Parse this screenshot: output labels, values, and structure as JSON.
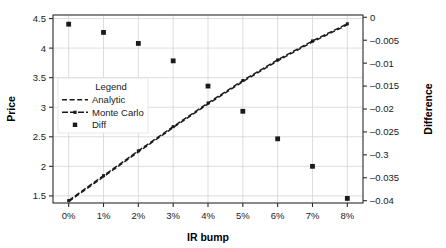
{
  "chart_data": {
    "type": "scatter",
    "title": "",
    "xlabel": "IR bump",
    "ylabel": "Price",
    "y2label": "Difference",
    "grid": true,
    "legend_position": "center-left",
    "legend_title": "Legend",
    "x": [
      0,
      1,
      2,
      3,
      4,
      5,
      6,
      7,
      8
    ],
    "xtick_labels": [
      "0%",
      "1%",
      "2%",
      "3%",
      "4%",
      "5%",
      "6%",
      "7%",
      "8%"
    ],
    "xlim": [
      -0.45,
      8.45
    ],
    "ylim": [
      1.38,
      4.56
    ],
    "ytick_values": [
      4.5,
      4,
      3.5,
      3,
      2.5,
      2,
      1.5
    ],
    "ytick_labels": [
      "4.5",
      "4",
      "3.5",
      "3",
      "2.5",
      "2",
      "1.5"
    ],
    "y2lim": [
      -0.0405,
      0.0005
    ],
    "y2tick_values": [
      0,
      -0.005,
      -0.01,
      -0.015,
      -0.02,
      -0.025,
      -0.03,
      -0.035,
      -0.04
    ],
    "y2tick_labels": [
      "0",
      "–0.005",
      "–0.01",
      "–0.015",
      "–0.02",
      "–0.025",
      "–0.3",
      "–0.035",
      "–0.04"
    ],
    "series": [
      {
        "name": "Analytic",
        "type": "line",
        "axis": "left",
        "style": "dashed",
        "values": [
          1.41,
          1.83,
          2.25,
          2.66,
          3.06,
          3.44,
          3.79,
          4.11,
          4.4
        ]
      },
      {
        "name": "Monte Carlo",
        "type": "line",
        "axis": "left",
        "style": "dashed-marker",
        "values": [
          1.412,
          1.833,
          2.253,
          2.662,
          3.062,
          3.442,
          3.792,
          4.112,
          4.402
        ]
      },
      {
        "name": "Diff",
        "type": "scatter",
        "axis": "right",
        "style": "square-marker",
        "values": [
          -0.0015,
          -0.0033,
          -0.0057,
          -0.0095,
          -0.015,
          -0.0205,
          -0.0265,
          -0.0325,
          -0.0395
        ]
      }
    ]
  },
  "legend": {
    "title": "Legend",
    "entries": [
      {
        "label": "Analytic",
        "marker": "dashed-line"
      },
      {
        "label": "Monte Carlo",
        "marker": "dashed-line-with-dot"
      },
      {
        "label": "Diff",
        "marker": "square"
      }
    ]
  },
  "colors": {
    "line": "#1a1a1a",
    "marker": "#1a1a1a",
    "grid": "#d4d4d4",
    "frame": "#2b2b2b",
    "background": "#ffffff"
  }
}
